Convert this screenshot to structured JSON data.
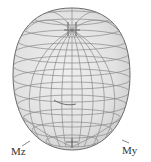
{
  "figure": {
    "axes": {
      "z_label": "Mz",
      "y_label": "My"
    },
    "colors": {
      "background": "#ffffff",
      "surface_fill": "#e4e4e4",
      "wire": "#8a8a8a",
      "wire_dark": "#5e5e5e",
      "label": "#333333"
    }
  }
}
